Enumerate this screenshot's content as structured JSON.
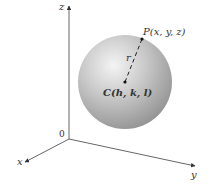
{
  "diagram": {
    "axes": {
      "x_label": "x",
      "y_label": "y",
      "z_label": "z",
      "origin_label": "0"
    },
    "sphere": {
      "fill_light": "#eeeeee",
      "fill_mid": "#bdbdbd",
      "fill_dark": "#8e8e8e"
    },
    "points": {
      "P_label": "P(x, y, z)",
      "C_label": "C(h, k, l)"
    },
    "radius_label": "r"
  }
}
